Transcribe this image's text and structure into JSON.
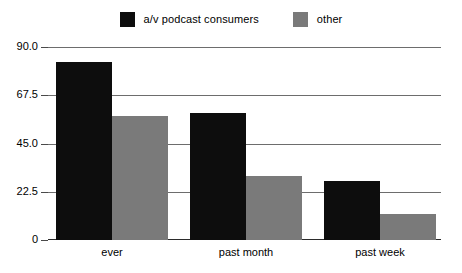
{
  "chart_data": {
    "type": "bar",
    "title": "",
    "xlabel": "",
    "ylabel": "",
    "categories": [
      "ever",
      "past month",
      "past week"
    ],
    "series": [
      {
        "name": "a/v podcast consumers",
        "color": "#0d0d0d",
        "values": [
          83,
          59,
          27.5
        ]
      },
      {
        "name": "other",
        "color": "#7a7a7a",
        "values": [
          58,
          30,
          12
        ]
      }
    ],
    "ylim": [
      0,
      90
    ],
    "yticks": [
      {
        "value": 90,
        "label": "90.0"
      },
      {
        "value": 67.5,
        "label": "67.5"
      },
      {
        "value": 45,
        "label": "45.0"
      },
      {
        "value": 22.5,
        "label": "22.5"
      },
      {
        "value": 0,
        "label": "0"
      }
    ],
    "grid": true,
    "legend_position": "top-center",
    "orientation": "vertical",
    "grouped": true
  },
  "legend": {
    "entries": [
      {
        "label": "a/v podcast consumers",
        "color": "#0d0d0d"
      },
      {
        "label": "other",
        "color": "#7a7a7a"
      }
    ]
  },
  "axis": {
    "y_tick_labels": [
      "90.0",
      "67.5",
      "45.0",
      "22.5",
      "0"
    ],
    "x_tick_labels": [
      "ever",
      "past month",
      "past week"
    ]
  },
  "colors": {
    "series_primary": "#0d0d0d",
    "series_secondary": "#7a7a7a",
    "gridline": "#6d6d6d",
    "axis": "#2b2b2b",
    "background": "#ffffff"
  }
}
